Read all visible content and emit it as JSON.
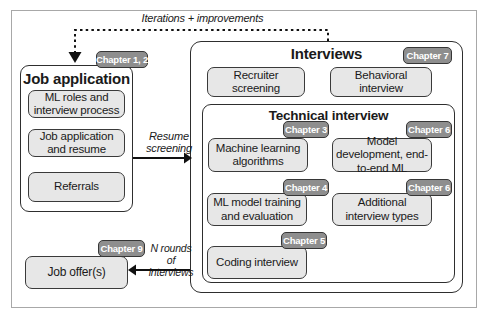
{
  "figure": {
    "iterations_label": "Iterations + improvements",
    "resume_screening_label": "Resume screening",
    "n_rounds_label": "N rounds of interviews"
  },
  "job_application": {
    "title": "Job application",
    "badge": "Chapter 1, 2",
    "items": [
      {
        "label": "ML roles and interview process"
      },
      {
        "label": "Job application and resume"
      },
      {
        "label": "Referrals"
      }
    ]
  },
  "interviews": {
    "title": "Interviews",
    "badge": "Chapter 7",
    "items": [
      {
        "label": "Recruiter screening"
      },
      {
        "label": "Behavioral interview"
      }
    ],
    "technical": {
      "title": "Technical interview",
      "items": [
        {
          "label": "Machine learning algorithms",
          "badge": "Chapter 3"
        },
        {
          "label": "Model development, end-to-end ML",
          "badge": "Chapter 6"
        },
        {
          "label": "ML model training and evaluation",
          "badge": "Chapter 4"
        },
        {
          "label": "Additional interview types",
          "badge": "Chapter 6"
        },
        {
          "label": "Coding interview",
          "badge": "Chapter 5"
        }
      ]
    }
  },
  "job_offer": {
    "title": "Job offer(s)",
    "badge": "Chapter 9"
  },
  "colors": {
    "badge_background": "#8e8e8e",
    "badge_border": "#363636",
    "badge_text": "#ffffff",
    "box_border": "#2e2e2e",
    "item_background": "#e7e7e7",
    "frame_border": "#a8a8a8",
    "arrow": "#111111",
    "text": "#1a1a1a"
  }
}
